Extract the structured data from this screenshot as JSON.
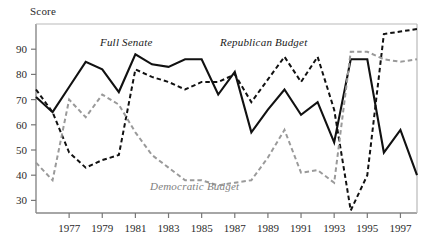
{
  "chart_data": {
    "type": "line",
    "title": "",
    "subtitle": "",
    "xlabel": "",
    "ylabel": "Score",
    "xlim": [
      1975,
      1998
    ],
    "ylim": [
      25,
      100
    ],
    "grid": false,
    "legend_position": "inline-annotations",
    "x": [
      1975,
      1976,
      1977,
      1978,
      1979,
      1980,
      1981,
      1982,
      1983,
      1984,
      1985,
      1986,
      1987,
      1988,
      1989,
      1990,
      1991,
      1992,
      1993,
      1994,
      1995,
      1996,
      1997,
      1998
    ],
    "xticks": [
      1977,
      1979,
      1981,
      1983,
      1985,
      1987,
      1989,
      1991,
      1993,
      1995,
      1997
    ],
    "xticklabels": [
      "1977",
      "1979",
      "1981",
      "1983",
      "1985",
      "1987",
      "1989",
      "1991",
      "1993",
      "1995",
      "1997"
    ],
    "yticks": [
      30,
      40,
      50,
      60,
      70,
      80,
      90
    ],
    "yticklabels": [
      "30",
      "40",
      "50",
      "60",
      "70",
      "80",
      "90"
    ],
    "series": [
      {
        "name": "Full Senate",
        "style": "solid",
        "color": "#111111",
        "values": [
          71,
          65,
          75,
          85,
          82,
          73,
          88,
          84,
          83,
          86,
          86,
          72,
          81,
          57,
          66,
          74,
          64,
          69,
          53,
          86,
          86,
          49,
          58,
          40
        ]
      },
      {
        "name": "Republican Budget",
        "style": "dashed",
        "color": "#111111",
        "values": [
          74,
          65,
          49,
          43,
          46,
          48,
          82,
          79,
          77,
          74,
          77,
          77,
          80,
          69,
          78,
          87,
          77,
          87,
          66,
          26,
          40,
          96,
          97,
          98
        ]
      },
      {
        "name": "Democratic Budget",
        "style": "dashed",
        "color": "#9a9a9a",
        "values": [
          45,
          38,
          70,
          63,
          72,
          68,
          57,
          48,
          43,
          38,
          38,
          36,
          37,
          38,
          47,
          58,
          41,
          42,
          37,
          89,
          89,
          86,
          85,
          86
        ]
      }
    ],
    "annotations": [
      {
        "text": "Full Senate",
        "series": "Full Senate"
      },
      {
        "text": "Republican Budget",
        "series": "Republican Budget"
      },
      {
        "text": "Democratic Budget",
        "series": "Democratic Budget"
      }
    ]
  },
  "axis": {
    "y_axis_label": "Score"
  },
  "labels": {
    "full_senate": "Full Senate",
    "republican_budget": "Republican Budget",
    "democratic_budget": "Democratic Budget"
  }
}
